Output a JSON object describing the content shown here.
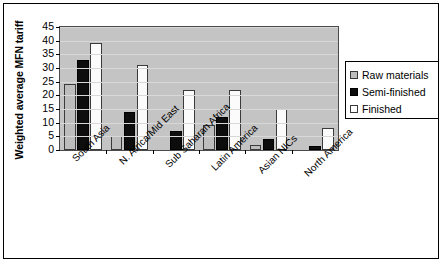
{
  "chart_data": {
    "type": "bar",
    "title": "",
    "xlabel": "",
    "ylabel": "Weighted average MFN tariff",
    "ylim": [
      0,
      45
    ],
    "yticks": [
      0,
      5,
      10,
      15,
      20,
      25,
      30,
      35,
      40,
      45
    ],
    "grid": true,
    "legend_position": "right",
    "categories": [
      "South Asia",
      "N. Africa/Mid East",
      "Sub Saharan Africa",
      "Latin America",
      "Asian NICs",
      "North America"
    ],
    "series": [
      {
        "name": "Raw materials",
        "color": "#bdbdbd",
        "values": [
          24,
          5,
          0,
          9,
          2,
          0
        ]
      },
      {
        "name": "Semi-finished",
        "color": "#0d0d0d",
        "values": [
          33,
          14,
          7,
          12,
          4,
          1.5
        ]
      },
      {
        "name": "Finished",
        "color": "#ffffff",
        "values": [
          39,
          31,
          22,
          22,
          15,
          8
        ]
      }
    ]
  },
  "legend": {
    "items": [
      {
        "label": "Raw materials"
      },
      {
        "label": "Semi-finished"
      },
      {
        "label": "Finished"
      }
    ]
  }
}
